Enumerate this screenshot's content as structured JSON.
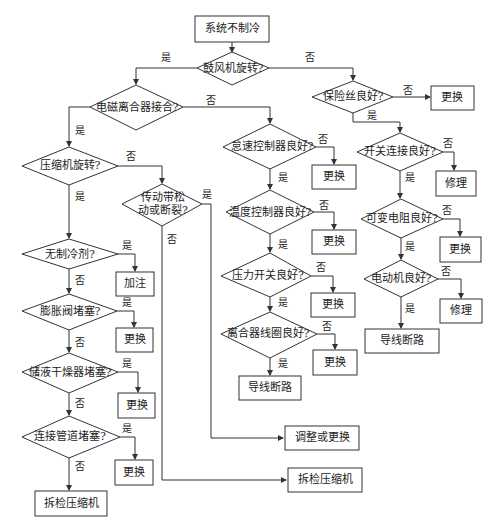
{
  "title": "系统不制冷",
  "colors": {
    "line": "#333333",
    "background": "#ffffff",
    "text": "#222222"
  },
  "labels": {
    "yes": "是",
    "no": "否"
  },
  "nodes": {
    "start": "系统不制冷",
    "blower": "鼓风机旋转?",
    "fuse": "保险丝良好?",
    "fuse_replace": "更换",
    "switch": "开关连接良好?",
    "switch_repair": "修理",
    "resistor": "可变电阻良好?",
    "resistor_replace": "更换",
    "motor": "电动机良好?",
    "motor_repair": "修理",
    "motor_ok": "导线断路",
    "clutch": "电磁离合器接合?",
    "idle_ctrl": "怠速控制器良好?",
    "idle_replace": "更换",
    "temp_ctrl": "温度控制器良好?",
    "temp_replace": "更换",
    "pressure_sw": "压力开关良好?",
    "pressure_replace": "更换",
    "coil": "离合器线圈良好?",
    "coil_replace": "更换",
    "coil_ok": "导线断路",
    "compressor": "压缩机旋转?",
    "belt_l1": "传动带松",
    "belt_l2": "动或断裂?",
    "belt_fix": "调整或更换",
    "belt_no": "拆检压缩机",
    "refrigerant": "无制冷剂?",
    "refill": "加注",
    "expansion": "膨胀阀堵塞?",
    "expansion_replace": "更换",
    "dryer": "储液干燥器堵塞?",
    "dryer_replace": "更换",
    "pipe": "连接管道堵塞?",
    "pipe_replace": "更换",
    "overhaul": "拆检压缩机"
  }
}
